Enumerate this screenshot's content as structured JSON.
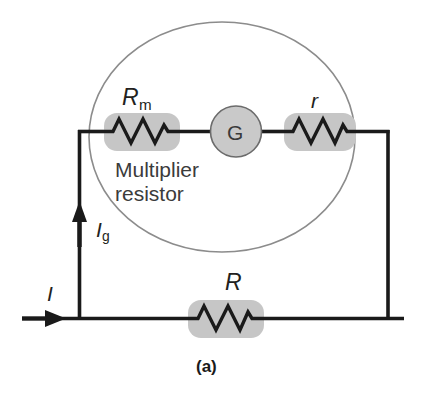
{
  "figure": {
    "caption": "(a)",
    "type": "electrical-circuit-diagram"
  },
  "colors": {
    "wire": "#1a1a1a",
    "resistor_fill": "#c6c6c6",
    "meter_fill": "#c9c9c9",
    "meter_stroke": "#6b6b6b",
    "enclosure_stroke": "#8c8c8c",
    "text": "#231f20",
    "background": "#ffffff"
  },
  "components": {
    "multiplier_resistor": {
      "label": "R",
      "subscript": "m",
      "caption_line1": "Multiplier",
      "caption_line2": "resistor",
      "name": "multiplier-resistor"
    },
    "galvanometer": {
      "label": "G",
      "name": "galvanometer"
    },
    "internal_resistance": {
      "label": "r",
      "subscript": "",
      "name": "internal-resistance"
    },
    "external_resistor": {
      "label": "R",
      "subscript": "",
      "name": "external-resistor"
    }
  },
  "currents": {
    "galvanometer_current": {
      "label": "I",
      "subscript": "g",
      "direction": "up",
      "name": "galvanometer-current"
    },
    "line_current": {
      "label": "I",
      "subscript": "",
      "direction": "right",
      "name": "line-current"
    }
  },
  "enclosure": {
    "shape": "ellipse",
    "name": "voltmeter-enclosure"
  }
}
